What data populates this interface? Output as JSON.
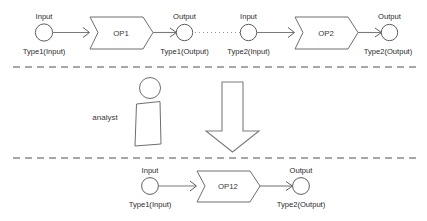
{
  "diagram": {
    "colors": {
      "stroke": "#6e6e6e",
      "text": "#2b2b2b",
      "divider": "#8a8a8a",
      "dotted": "#9a9a9a",
      "background": "#ffffff"
    },
    "dividers": [
      {
        "name": "divider-top",
        "y": 67
      },
      {
        "name": "divider-bottom",
        "y": 158
      }
    ],
    "bands": {
      "top": {
        "name": "composed-operations-band",
        "nodes": [
          {
            "id": "op1-input",
            "kind": "circle",
            "top_label": "Input",
            "bottom_label": "Type1(Input)"
          },
          {
            "id": "op1",
            "kind": "process",
            "label": "OP1"
          },
          {
            "id": "op1-output",
            "kind": "circle",
            "top_label": "Output",
            "bottom_label": "Type1(Output)"
          },
          {
            "id": "op2-input",
            "kind": "circle",
            "top_label": "Input",
            "bottom_label": "Type2(Input)"
          },
          {
            "id": "op2",
            "kind": "process",
            "label": "OP2"
          },
          {
            "id": "op2-output",
            "kind": "circle",
            "top_label": "Output",
            "bottom_label": "Type2(Output)"
          }
        ],
        "link_style": "dotted"
      },
      "middle": {
        "name": "analyst-band",
        "actor_label": "analyst",
        "transform_arrow": "down-arrow"
      },
      "bottom": {
        "name": "merged-operation-band",
        "nodes": [
          {
            "id": "op12-input",
            "kind": "circle",
            "top_label": "Input",
            "bottom_label": "Type1(Input)"
          },
          {
            "id": "op12",
            "kind": "process",
            "label": "OP12"
          },
          {
            "id": "op12-output",
            "kind": "circle",
            "top_label": "Output",
            "bottom_label": "Type2(Output)"
          }
        ]
      }
    }
  }
}
